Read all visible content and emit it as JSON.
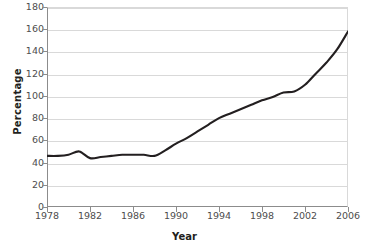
{
  "chart_data": {
    "type": "line",
    "title": "",
    "xlabel": "Year",
    "ylabel": "Percentage",
    "xlim": [
      1978,
      2006
    ],
    "ylim": [
      0,
      180
    ],
    "ytick_step": 20,
    "xtick_step": 4,
    "grid": true,
    "legend": "none",
    "line_color": "#231f20",
    "grid_color": "#d9d9d9",
    "axis_color": "#8c8c8c",
    "yticks": [
      180,
      160,
      140,
      120,
      100,
      80,
      60,
      40,
      20,
      0
    ],
    "xticks": [
      1978,
      1982,
      1986,
      1990,
      1994,
      1998,
      2002,
      2006
    ],
    "series": [
      {
        "name": "Percentage",
        "x": [
          1978,
          1979,
          1980,
          1981,
          1982,
          1983,
          1984,
          1985,
          1986,
          1987,
          1988,
          1989,
          1990,
          1991,
          1992,
          1993,
          1994,
          1995,
          1996,
          1997,
          1998,
          1999,
          2000,
          2001,
          2002,
          2003,
          2004,
          2005,
          2006
        ],
        "values": [
          46,
          46,
          47,
          50,
          44,
          45,
          46,
          47,
          47,
          47,
          46,
          51,
          57,
          62,
          68,
          74,
          80,
          84,
          88,
          92,
          96,
          99,
          103,
          104,
          110,
          120,
          130,
          142,
          158
        ]
      }
    ]
  }
}
